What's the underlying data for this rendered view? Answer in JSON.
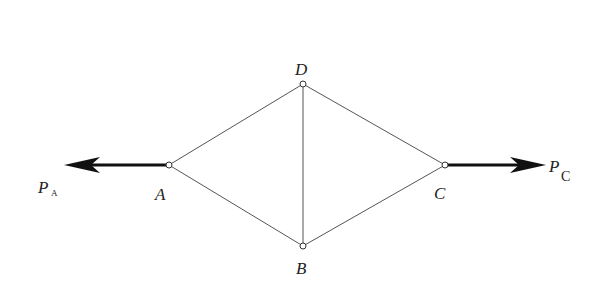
{
  "diagram": {
    "type": "truss",
    "nodes": [
      {
        "id": "A",
        "label": "A",
        "x": 169,
        "y": 165
      },
      {
        "id": "B",
        "label": "B",
        "x": 303,
        "y": 246
      },
      {
        "id": "C",
        "label": "C",
        "x": 445,
        "y": 165
      },
      {
        "id": "D",
        "label": "D",
        "x": 303,
        "y": 84
      }
    ],
    "members": [
      [
        "A",
        "D"
      ],
      [
        "A",
        "B"
      ],
      [
        "D",
        "C"
      ],
      [
        "B",
        "C"
      ],
      [
        "D",
        "B"
      ]
    ],
    "forces": [
      {
        "id": "PA",
        "symbol": "P",
        "subscript": "A",
        "at": "A",
        "direction": "left"
      },
      {
        "id": "PC",
        "symbol": "P",
        "subscript": "C",
        "at": "C",
        "direction": "right"
      }
    ],
    "labels": {
      "A": "A",
      "B": "B",
      "C": "C",
      "D": "D",
      "PA_main": "P",
      "PA_sub": "A",
      "PC_main": "P",
      "PC_sub": "C"
    }
  }
}
